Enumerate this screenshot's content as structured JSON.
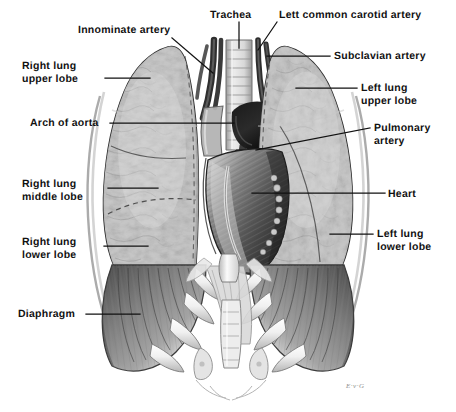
{
  "figure": {
    "width": 456,
    "height": 412,
    "background_color": "#ffffff",
    "ink_color": "#111111",
    "style": "grayscale medical illustration, pen and wash"
  },
  "signature": {
    "text": "E·v·G"
  },
  "labels": [
    {
      "id": "innominate-artery",
      "text": "Innominate artery",
      "x": 78,
      "y": 24,
      "align": "left",
      "leader": {
        "x1": 172,
        "y1": 38,
        "x2": 213,
        "y2": 73
      }
    },
    {
      "id": "trachea",
      "text": "Trachea",
      "x": 210,
      "y": 9,
      "align": "left",
      "leader": {
        "x1": 239,
        "y1": 22,
        "x2": 239,
        "y2": 48
      }
    },
    {
      "id": "left-common-carotid-artery",
      "text": "Lett common carotid artery",
      "x": 279,
      "y": 9,
      "align": "left",
      "leader": {
        "x1": 277,
        "y1": 22,
        "x2": 258,
        "y2": 50
      }
    },
    {
      "id": "subclavian-artery",
      "text": "Subclavian artery",
      "x": 334,
      "y": 50,
      "align": "left",
      "leader": {
        "x1": 330,
        "y1": 56,
        "x2": 267,
        "y2": 56
      }
    },
    {
      "id": "right-lung-upper-lobe",
      "text": "Right lung\nupper lobe",
      "x": 22,
      "y": 60,
      "align": "left",
      "leader": {
        "x1": 105,
        "y1": 78,
        "x2": 150,
        "y2": 78
      }
    },
    {
      "id": "left-lung-upper-lobe",
      "text": "Left lung\nupper lobe",
      "x": 361,
      "y": 82,
      "align": "left",
      "leader": {
        "x1": 357,
        "y1": 88,
        "x2": 296,
        "y2": 88
      }
    },
    {
      "id": "arch-of-aorta",
      "text": "Arch of aorta",
      "x": 30,
      "y": 117,
      "align": "left",
      "leader": {
        "x1": 110,
        "y1": 123,
        "x2": 234,
        "y2": 123
      }
    },
    {
      "id": "pulmonary-artery",
      "text": "Pulmonary\nartery",
      "x": 374,
      "y": 122,
      "align": "left",
      "leader": {
        "x1": 370,
        "y1": 128,
        "x2": 256,
        "y2": 150
      }
    },
    {
      "id": "right-lung-middle-lobe",
      "text": "Right lung\nmiddle lobe",
      "x": 22,
      "y": 178,
      "align": "left",
      "leader": {
        "x1": 108,
        "y1": 188,
        "x2": 158,
        "y2": 188
      }
    },
    {
      "id": "heart",
      "text": "Heart",
      "x": 388,
      "y": 188,
      "align": "left",
      "leader": {
        "x1": 385,
        "y1": 193,
        "x2": 252,
        "y2": 193
      }
    },
    {
      "id": "right-lung-lower-lobe",
      "text": "Right lung\nlower lobe",
      "x": 22,
      "y": 236,
      "align": "left",
      "leader": {
        "x1": 104,
        "y1": 246,
        "x2": 148,
        "y2": 246
      }
    },
    {
      "id": "left-lung-lower-lobe",
      "text": "Left lung\nlower lobe",
      "x": 377,
      "y": 228,
      "align": "left",
      "leader": {
        "x1": 373,
        "y1": 234,
        "x2": 330,
        "y2": 234
      }
    },
    {
      "id": "diaphragm",
      "text": "Diaphragm",
      "x": 18,
      "y": 308,
      "align": "left",
      "leader": {
        "x1": 86,
        "y1": 314,
        "x2": 140,
        "y2": 314
      }
    }
  ]
}
